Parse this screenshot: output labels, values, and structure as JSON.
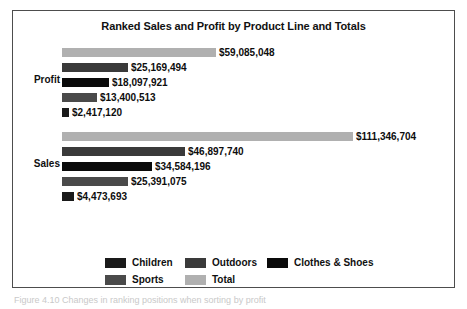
{
  "chart_data": {
    "type": "bar",
    "orientation": "horizontal",
    "title": "Ranked Sales and Profit by Product Line and Totals",
    "xlabel": "",
    "ylabel": "",
    "grid": false,
    "legend_position": "bottom",
    "xlim": [
      0,
      111346704
    ],
    "categories": [
      "Profit",
      "Sales"
    ],
    "series": [
      {
        "name": "Total",
        "color": "#b0b0b0",
        "values": [
          59085048,
          111346704
        ]
      },
      {
        "name": "Outdoors",
        "color": "#3a3a3a",
        "values": [
          25169494,
          46897740
        ]
      },
      {
        "name": "Clothes & Shoes",
        "color": "#0a0a0a",
        "values": [
          18097921,
          34584196
        ]
      },
      {
        "name": "Sports",
        "color": "#4a4a4a",
        "values": [
          13400513,
          25391075
        ]
      },
      {
        "name": "Children",
        "color": "#1a1a1a",
        "values": [
          2417120,
          4473693
        ]
      }
    ],
    "groups": [
      {
        "label": "Profit",
        "bars": [
          {
            "series": "Total",
            "value": 59085048,
            "value_label": "$59,085,048",
            "color": "#b0b0b0",
            "width_px": 154
          },
          {
            "series": "Outdoors",
            "value": 25169494,
            "value_label": "$25,169,494",
            "color": "#3a3a3a",
            "width_px": 66
          },
          {
            "series": "Clothes & Shoes",
            "value": 18097921,
            "value_label": "$18,097,921",
            "color": "#0a0a0a",
            "width_px": 47
          },
          {
            "series": "Sports",
            "value": 13400513,
            "value_label": "$13,400,513",
            "color": "#4a4a4a",
            "width_px": 35
          },
          {
            "series": "Children",
            "value": 2417120,
            "value_label": "$2,417,120",
            "color": "#1a1a1a",
            "width_px": 7
          }
        ]
      },
      {
        "label": "Sales",
        "bars": [
          {
            "series": "Total",
            "value": 111346704,
            "value_label": "$111,346,704",
            "color": "#b0b0b0",
            "width_px": 291
          },
          {
            "series": "Outdoors",
            "value": 46897740,
            "value_label": "$46,897,740",
            "color": "#3a3a3a",
            "width_px": 123
          },
          {
            "series": "Clothes & Shoes",
            "value": 34584196,
            "value_label": "$34,584,196",
            "color": "#0a0a0a",
            "width_px": 90
          },
          {
            "series": "Sports",
            "value": 25391075,
            "value_label": "$25,391,075",
            "color": "#4a4a4a",
            "width_px": 66
          },
          {
            "series": "Children",
            "value": 4473693,
            "value_label": "$4,473,693",
            "color": "#1a1a1a",
            "width_px": 12
          }
        ]
      }
    ],
    "legend": [
      {
        "label": "Children",
        "color": "#1a1a1a"
      },
      {
        "label": "Outdoors",
        "color": "#3a3a3a"
      },
      {
        "label": "Clothes & Shoes",
        "color": "#0a0a0a"
      },
      {
        "label": "Sports",
        "color": "#4a4a4a"
      },
      {
        "label": "Total",
        "color": "#b0b0b0"
      }
    ]
  },
  "caption": "Figure 4.10  Changes in ranking positions when sorting by profit"
}
